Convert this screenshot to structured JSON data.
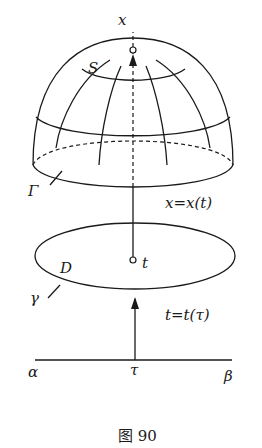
{
  "figure": {
    "caption": "图 90",
    "labels": {
      "point_x": "x",
      "surface": "S",
      "boundary_surface": "Γ",
      "map_x": "x=x(t)",
      "domain": "D",
      "point_t": "t",
      "boundary_domain": "γ",
      "map_t": "t=t(τ)",
      "interval_start": "α",
      "interval_point": "τ",
      "interval_end": "β"
    }
  }
}
